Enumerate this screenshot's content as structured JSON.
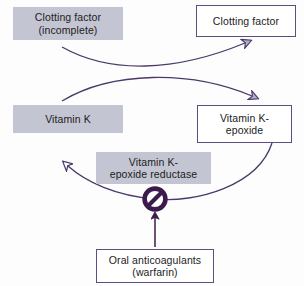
{
  "diagram": {
    "colors": {
      "box_fill_gray": "#c4c5d2",
      "box_outline_purple": "#5f4c80",
      "arrow_purple": "#4b3a68",
      "inhibitor_purple": "#3d1a4e",
      "background": "#fdfdfd",
      "text": "#1c1c1c"
    },
    "nodes": [
      {
        "id": "clotting-factor-incomplete",
        "style": "filled",
        "lines": [
          "Clotting factor",
          "(incomplete)"
        ]
      },
      {
        "id": "clotting-factor",
        "style": "outlined",
        "lines": [
          "Clotting factor"
        ]
      },
      {
        "id": "vitamin-k",
        "style": "filled",
        "lines": [
          "Vitamin K"
        ]
      },
      {
        "id": "vitamin-k-epoxide",
        "style": "outlined",
        "lines": [
          "Vitamin K-",
          "epoxide"
        ]
      },
      {
        "id": "vitamin-k-epoxide-reductase",
        "style": "filled",
        "lines": [
          "Vitamin K-",
          "epoxide reductase"
        ]
      },
      {
        "id": "oral-anticoagulants",
        "style": "outlined",
        "lines": [
          "Oral anticoagulants",
          "(warfarin)"
        ]
      }
    ],
    "connectors": [
      {
        "id": "incomplete-to-clotting-factor",
        "kind": "curved-arrow",
        "from": "clotting-factor-incomplete",
        "to": "clotting-factor"
      },
      {
        "id": "vitamin-k-to-epoxide",
        "kind": "curved-arrow",
        "from": "vitamin-k",
        "to": "vitamin-k-epoxide"
      },
      {
        "id": "epoxide-to-vitamin-k",
        "kind": "curved-arrow",
        "from": "vitamin-k-epoxide",
        "to": "vitamin-k"
      },
      {
        "id": "warfarin-inhibits-reductase",
        "kind": "straight-arrow",
        "from": "oral-anticoagulants",
        "to": "inhibition-symbol"
      }
    ],
    "symbols": [
      {
        "id": "inhibition-symbol",
        "name": "no-entry-icon",
        "meaning": "inhibition"
      }
    ]
  }
}
